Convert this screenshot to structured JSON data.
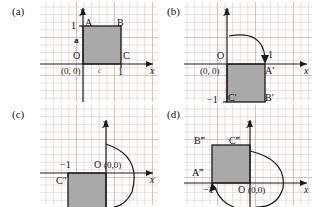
{
  "figure": {
    "square_fill": "#a9a9a9",
    "square_stroke": "#1a1a1a",
    "grid_line_color": "#e1d0d1",
    "grid_major_color": "#c6aaac",
    "axis_color": "#1a1a1a"
  },
  "panels": [
    {
      "tag": "(a)",
      "name": "panel-a-original-square",
      "axis_x_label": "x",
      "axis_y_label": "y",
      "origin_label": "O",
      "origin_coords": "(0, 0)",
      "tick_y": "1",
      "tick_x": "1",
      "vertices": [
        {
          "name": "A",
          "label": "A"
        },
        {
          "name": "B",
          "label": "B"
        },
        {
          "name": "C",
          "label": "C"
        }
      ],
      "vector_labels": [
        {
          "name": "a",
          "label": "a"
        },
        {
          "name": "c",
          "label": "c"
        }
      ]
    },
    {
      "tag": "(b)",
      "name": "panel-b-rotated-90",
      "axis_x_label": "x",
      "axis_y_label": "y",
      "origin_label": "O",
      "origin_coords": "(0, 0)",
      "tick_x": "1",
      "tick_y": "−1",
      "vertices": [
        {
          "name": "A-prime",
          "label": "A′"
        },
        {
          "name": "B-prime",
          "label": "B′"
        },
        {
          "name": "C-prime",
          "label": "C′"
        }
      ]
    },
    {
      "tag": "(c)",
      "name": "panel-c-rotated-180",
      "axis_x_label": "x",
      "axis_y_label": "y",
      "origin_label": "O",
      "origin_coords": "(0,0)",
      "tick_x": "−1",
      "vertices": [
        {
          "name": "C-double-prime",
          "label": "C″"
        }
      ]
    },
    {
      "tag": "(d)",
      "name": "panel-d-rotated-270",
      "axis_x_label": "x",
      "axis_y_label": "y",
      "origin_label": "O",
      "origin_coords": "(0,0)",
      "tick_x": "−1",
      "vertices": [
        {
          "name": "A-triple-prime",
          "label": "A‴"
        },
        {
          "name": "B-triple-prime",
          "label": "B‴"
        },
        {
          "name": "C-triple-prime",
          "label": "C‴"
        }
      ]
    }
  ]
}
